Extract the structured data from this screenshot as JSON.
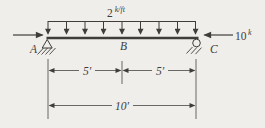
{
  "figure": {
    "distributed_load": {
      "value": "2",
      "unit": "k/ft"
    },
    "axial_load": {
      "value": "10",
      "unit": "k"
    },
    "node_labels": {
      "a": "A",
      "b": "B",
      "c": "C"
    },
    "dimensions": {
      "left_span": "5′",
      "right_span": "5′",
      "total_span": "10′"
    }
  },
  "colors": {
    "ink": "#3f3d3a",
    "ink_light": "#5a5855",
    "background": "#f0eeea"
  }
}
